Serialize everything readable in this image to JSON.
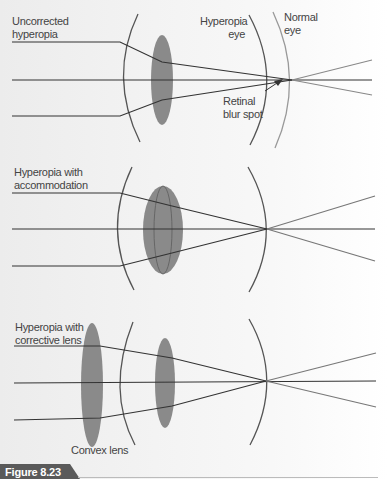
{
  "panels": [
    {
      "title_line1": "Uncorrected",
      "title_line2": "hyperopia",
      "labels": {
        "hyperopia_eye_1": "Hyperopia",
        "hyperopia_eye_2": "eye",
        "normal_eye_1": "Normal",
        "normal_eye_2": "eye",
        "blur_1": "Retinal",
        "blur_2": "blur spot"
      }
    },
    {
      "title_line1": "Hyperopia with",
      "title_line2": "accommodation"
    },
    {
      "title_line1": "Hyperopia with",
      "title_line2": "corrective lens",
      "labels": {
        "convex_lens": "Convex lens"
      }
    }
  ],
  "figure": {
    "label": "Figure 8.23"
  },
  "colors": {
    "line": "#3a3a3a",
    "lens": "#8a8a8a",
    "badge": "#5a5a5a",
    "normal_eye_arc": "#9a9a9a"
  }
}
